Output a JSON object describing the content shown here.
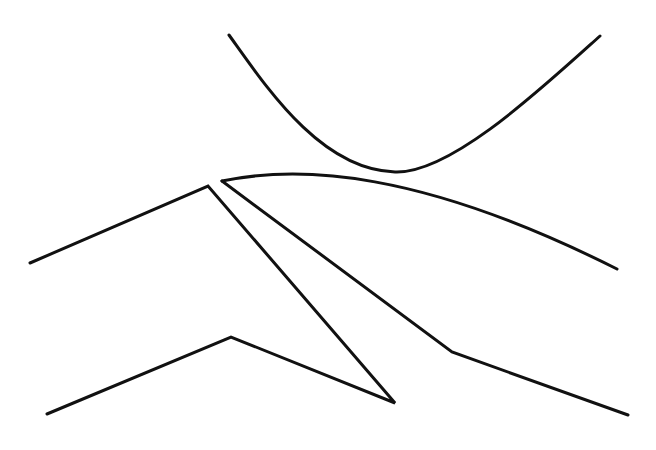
{
  "diagram": {
    "background": "#ffffff",
    "stroke_color": "#111111",
    "stroke_width": 3,
    "shapes": [
      {
        "name": "upper-parabola-curve",
        "type": "path",
        "d": "M229,35 C265,85 320,170 395,172 C450,174 540,90 600,36"
      },
      {
        "name": "sweeping-arc-curve",
        "type": "path",
        "d": "M222,181 C300,165 420,170 617,269"
      },
      {
        "name": "left-peak-polyline",
        "type": "polyline",
        "points": "30,263 208,186 395,403 231,337 47,414"
      },
      {
        "name": "right-diagonal-polyline",
        "type": "polyline",
        "points": "222,181 452,352 628,415"
      }
    ]
  }
}
